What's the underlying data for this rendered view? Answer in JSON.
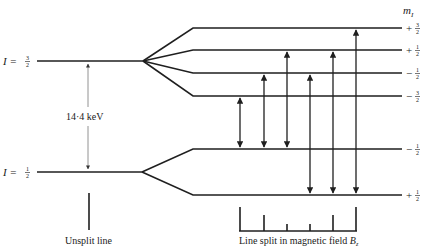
{
  "diagram": {
    "type": "nuclear-zeeman-splitting",
    "column_header": "m_I",
    "column_header_main": "m",
    "column_header_sub": "I",
    "upper_level": {
      "label": "I = 3/2",
      "label_main": "I = ",
      "label_num": "3",
      "label_den": "2",
      "sublevels": [
        {
          "sign": "+",
          "num": "3",
          "den": "2",
          "label": "+3/2",
          "y": 28
        },
        {
          "sign": "+",
          "num": "1",
          "den": "2",
          "label": "+1/2",
          "y": 50
        },
        {
          "sign": "−",
          "num": "1",
          "den": "2",
          "label": "−1/2",
          "y": 73
        },
        {
          "sign": "−",
          "num": "3",
          "den": "2",
          "label": "−3/2",
          "y": 96
        }
      ]
    },
    "lower_level": {
      "label": "I = 1/2",
      "label_main": "I = ",
      "label_num": "1",
      "label_den": "2",
      "sublevels": [
        {
          "sign": "−",
          "num": "1",
          "den": "2",
          "label": "−1/2",
          "y": 149
        },
        {
          "sign": "+",
          "num": "1",
          "den": "2",
          "label": "+1/2",
          "y": 195
        }
      ]
    },
    "energy_gap_label": "14·4 keV",
    "transitions": [
      {
        "from": "−1/2 (lower)",
        "to": "−3/2 (upper)",
        "x": 240
      },
      {
        "from": "−1/2 (lower)",
        "to": "−1/2 (upper)",
        "x": 264
      },
      {
        "from": "−1/2 (lower)",
        "to": "+1/2 (upper)",
        "x": 287
      },
      {
        "from": "+1/2 (lower)",
        "to": "−1/2 (upper)",
        "x": 310
      },
      {
        "from": "+1/2 (lower)",
        "to": "+1/2 (upper)",
        "x": 333
      },
      {
        "from": "+1/2 (lower)",
        "to": "+3/2 (upper)",
        "x": 356
      }
    ],
    "spectrum_line_heights": [
      3,
      2,
      1,
      1,
      2,
      3
    ],
    "captions": {
      "unsplit": "Unsplit line",
      "split": "Line split in magnetic field ",
      "split_field": "B",
      "split_field_sub": "z"
    }
  }
}
